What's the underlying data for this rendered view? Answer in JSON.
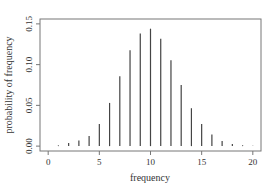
{
  "chart_data": {
    "type": "bar",
    "style": "vertical-lines",
    "title": "",
    "xlabel": "frequency",
    "ylabel": "probability of frequency",
    "x": [
      0,
      1,
      2,
      3,
      4,
      5,
      6,
      7,
      8,
      9,
      10,
      11,
      12,
      13,
      14,
      15,
      16,
      17,
      18,
      19,
      20
    ],
    "values": [
      0.0001,
      0.0009,
      0.0037,
      0.0069,
      0.0125,
      0.0272,
      0.053,
      0.0857,
      0.1177,
      0.1381,
      0.1441,
      0.1318,
      0.1054,
      0.075,
      0.0465,
      0.0271,
      0.0144,
      0.0064,
      0.0026,
      0.001,
      0.0003
    ],
    "xlim": [
      -0.8,
      20.8
    ],
    "ylim": [
      -0.006,
      0.156
    ],
    "xticks": [
      0,
      5,
      10,
      15,
      20
    ],
    "yticks": [
      0.0,
      0.05,
      0.1,
      0.15
    ],
    "xtick_labels": [
      "0",
      "5",
      "10",
      "15",
      "20"
    ],
    "ytick_labels": [
      "0.00",
      "0.05",
      "0.10",
      "0.15"
    ],
    "grid": false,
    "legend": null,
    "colors": {
      "bars": "#444444",
      "axes": "#777777",
      "text": "#333333"
    }
  }
}
